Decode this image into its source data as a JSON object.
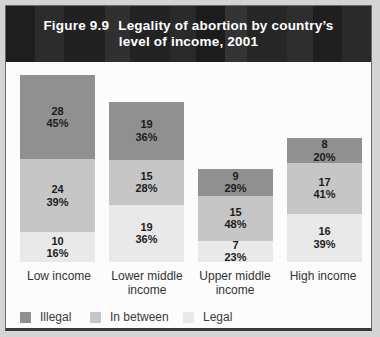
{
  "header": {
    "figure_label": "Figure 9.9",
    "title_line1": "Legality of abortion by country’s",
    "title_line2": "level of income, 2001"
  },
  "legend": {
    "items": [
      {
        "label": "Illegal",
        "color": "#909090"
      },
      {
        "label": "In between",
        "color": "#c6c6c6"
      },
      {
        "label": "Legal",
        "color": "#e9e9e9"
      }
    ]
  },
  "chart_data": {
    "type": "bar",
    "subtype": "stacked",
    "title": "Legality of abortion by country’s level of income, 2001",
    "xlabel": "",
    "ylabel": "",
    "grid": false,
    "legend_position": "bottom",
    "value_label_format": "count over percent",
    "categories": [
      "Low income",
      "Lower middle income",
      "Upper middle income",
      "High income"
    ],
    "series": [
      {
        "name": "Illegal",
        "counts": [
          28,
          19,
          9,
          8
        ],
        "percents": [
          45,
          36,
          29,
          20
        ]
      },
      {
        "name": "In between",
        "counts": [
          24,
          15,
          15,
          17
        ],
        "percents": [
          39,
          28,
          48,
          41
        ]
      },
      {
        "name": "Legal",
        "counts": [
          10,
          19,
          7,
          16
        ],
        "percents": [
          16,
          36,
          23,
          39
        ]
      }
    ],
    "bar_totals": [
      62,
      53,
      31,
      41
    ],
    "colors": {
      "Illegal": "#909090",
      "In between": "#c6c6c6",
      "Legal": "#e9e9e9"
    },
    "bars": [
      {
        "category": "Low income",
        "total": 62,
        "segments": [
          {
            "name": "Illegal",
            "count": 28,
            "pct": 45,
            "pct_label": "45%"
          },
          {
            "name": "In between",
            "count": 24,
            "pct": 39,
            "pct_label": "39%"
          },
          {
            "name": "Legal",
            "count": 10,
            "pct": 16,
            "pct_label": "16%"
          }
        ]
      },
      {
        "category": "Lower middle income",
        "total": 53,
        "segments": [
          {
            "name": "Illegal",
            "count": 19,
            "pct": 36,
            "pct_label": "36%"
          },
          {
            "name": "In between",
            "count": 15,
            "pct": 28,
            "pct_label": "28%"
          },
          {
            "name": "Legal",
            "count": 19,
            "pct": 36,
            "pct_label": "36%"
          }
        ]
      },
      {
        "category": "Upper middle income",
        "total": 31,
        "segments": [
          {
            "name": "Illegal",
            "count": 9,
            "pct": 29,
            "pct_label": "29%"
          },
          {
            "name": "In between",
            "count": 15,
            "pct": 48,
            "pct_label": "48%"
          },
          {
            "name": "Legal",
            "count": 7,
            "pct": 23,
            "pct_label": "23%"
          }
        ]
      },
      {
        "category": "High income",
        "total": 41,
        "segments": [
          {
            "name": "Illegal",
            "count": 8,
            "pct": 20,
            "pct_label": "20%"
          },
          {
            "name": "In between",
            "count": 17,
            "pct": 41,
            "pct_label": "41%"
          },
          {
            "name": "Legal",
            "count": 16,
            "pct": 39,
            "pct_label": "39%"
          }
        ]
      }
    ]
  }
}
